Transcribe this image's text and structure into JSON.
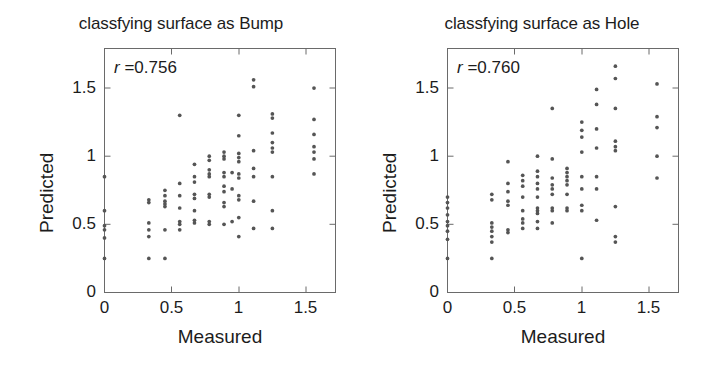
{
  "figure": {
    "background": "#ffffff",
    "point_color": "#555555",
    "axis_color": "#6a6a6a"
  },
  "panels": [
    {
      "id": "bump",
      "title": "classfying surface as Bump",
      "r_symbol": "r",
      "r_text": " =0.756",
      "annotation": "r =0.756"
    },
    {
      "id": "hole",
      "title": "classfying surface as Hole",
      "r_symbol": "r",
      "r_text": " =0.760",
      "annotation": "r =0.760"
    }
  ],
  "axes": {
    "xlabel": "Measured",
    "ylabel": "Predicted",
    "xticks": [
      "0",
      "0.5",
      "1",
      "1.5"
    ],
    "yticks": [
      "0",
      "0.5",
      "1",
      "1.5"
    ],
    "xtick_values": [
      0,
      0.5,
      1,
      1.5
    ],
    "ytick_values": [
      0,
      0.5,
      1,
      1.5
    ],
    "xlim": [
      0,
      1.72
    ],
    "ylim": [
      0,
      1.79
    ]
  },
  "chart_data": [
    {
      "type": "scatter",
      "title": "classfying surface as Bump",
      "xlabel": "Measured",
      "ylabel": "Predicted",
      "xlim": [
        0,
        1.72
      ],
      "ylim": [
        0,
        1.79
      ],
      "xticks": [
        0,
        0.5,
        1,
        1.5
      ],
      "yticks": [
        0,
        0.5,
        1,
        1.5
      ],
      "grid": false,
      "legend": "none",
      "annotations": [
        {
          "text": "r =0.756",
          "x": 0.08,
          "y": 1.66
        }
      ],
      "correlation_r": 0.756,
      "marker": {
        "shape": "circle",
        "size": 3,
        "color": "#555555"
      },
      "points": [
        [
          0.0,
          0.85
        ],
        [
          0.0,
          0.6
        ],
        [
          0.0,
          0.49
        ],
        [
          0.0,
          0.46
        ],
        [
          0.0,
          0.4
        ],
        [
          0.0,
          0.25
        ],
        [
          0.33,
          0.68
        ],
        [
          0.33,
          0.66
        ],
        [
          0.33,
          0.51
        ],
        [
          0.33,
          0.46
        ],
        [
          0.33,
          0.41
        ],
        [
          0.33,
          0.25
        ],
        [
          0.45,
          0.75
        ],
        [
          0.45,
          0.71
        ],
        [
          0.45,
          0.67
        ],
        [
          0.45,
          0.65
        ],
        [
          0.45,
          0.63
        ],
        [
          0.45,
          0.46
        ],
        [
          0.45,
          0.25
        ],
        [
          0.56,
          1.3
        ],
        [
          0.56,
          0.8
        ],
        [
          0.56,
          0.71
        ],
        [
          0.56,
          0.62
        ],
        [
          0.56,
          0.52
        ],
        [
          0.56,
          0.5
        ],
        [
          0.56,
          0.46
        ],
        [
          0.67,
          0.94
        ],
        [
          0.67,
          0.85
        ],
        [
          0.67,
          0.81
        ],
        [
          0.67,
          0.72
        ],
        [
          0.67,
          0.69
        ],
        [
          0.67,
          0.6
        ],
        [
          0.67,
          0.53
        ],
        [
          0.67,
          0.51
        ],
        [
          0.78,
          1.0
        ],
        [
          0.78,
          0.97
        ],
        [
          0.78,
          0.9
        ],
        [
          0.78,
          0.87
        ],
        [
          0.78,
          0.85
        ],
        [
          0.78,
          0.72
        ],
        [
          0.78,
          0.7
        ],
        [
          0.78,
          0.52
        ],
        [
          0.78,
          0.5
        ],
        [
          0.89,
          1.03
        ],
        [
          0.89,
          1.0
        ],
        [
          0.89,
          0.98
        ],
        [
          0.89,
          0.88
        ],
        [
          0.89,
          0.85
        ],
        [
          0.89,
          0.78
        ],
        [
          0.89,
          0.74
        ],
        [
          0.89,
          0.66
        ],
        [
          0.89,
          0.63
        ],
        [
          0.89,
          0.5
        ],
        [
          0.95,
          0.88
        ],
        [
          0.95,
          0.76
        ],
        [
          0.95,
          0.52
        ],
        [
          1.0,
          1.3
        ],
        [
          1.0,
          1.15
        ],
        [
          1.0,
          1.02
        ],
        [
          1.0,
          0.99
        ],
        [
          1.0,
          0.96
        ],
        [
          1.0,
          0.87
        ],
        [
          1.0,
          0.84
        ],
        [
          1.0,
          0.71
        ],
        [
          1.0,
          0.68
        ],
        [
          1.0,
          0.55
        ],
        [
          1.0,
          0.41
        ],
        [
          1.11,
          1.56
        ],
        [
          1.11,
          1.51
        ],
        [
          1.11,
          1.04
        ],
        [
          1.11,
          0.91
        ],
        [
          1.11,
          0.85
        ],
        [
          1.11,
          0.67
        ],
        [
          1.11,
          0.47
        ],
        [
          1.25,
          1.31
        ],
        [
          1.25,
          1.28
        ],
        [
          1.25,
          1.17
        ],
        [
          1.25,
          1.1
        ],
        [
          1.25,
          1.06
        ],
        [
          1.25,
          1.03
        ],
        [
          1.25,
          0.85
        ],
        [
          1.25,
          0.6
        ],
        [
          1.25,
          0.47
        ],
        [
          1.56,
          1.5
        ],
        [
          1.56,
          1.27
        ],
        [
          1.56,
          1.16
        ],
        [
          1.56,
          1.07
        ],
        [
          1.56,
          1.03
        ],
        [
          1.56,
          0.98
        ],
        [
          1.56,
          0.87
        ]
      ]
    },
    {
      "type": "scatter",
      "title": "classfying surface as Hole",
      "xlabel": "Measured",
      "ylabel": "Predicted",
      "xlim": [
        0,
        1.72
      ],
      "ylim": [
        0,
        1.79
      ],
      "xticks": [
        0,
        0.5,
        1,
        1.5
      ],
      "yticks": [
        0,
        0.5,
        1,
        1.5
      ],
      "grid": false,
      "legend": "none",
      "annotations": [
        {
          "text": "r =0.760",
          "x": 0.08,
          "y": 1.66
        }
      ],
      "correlation_r": 0.76,
      "marker": {
        "shape": "circle",
        "size": 3,
        "color": "#555555"
      },
      "points": [
        [
          0.0,
          0.7
        ],
        [
          0.0,
          0.66
        ],
        [
          0.0,
          0.62
        ],
        [
          0.0,
          0.57
        ],
        [
          0.0,
          0.52
        ],
        [
          0.0,
          0.49
        ],
        [
          0.0,
          0.45
        ],
        [
          0.0,
          0.39
        ],
        [
          0.0,
          0.25
        ],
        [
          0.33,
          0.72
        ],
        [
          0.33,
          0.68
        ],
        [
          0.33,
          0.51
        ],
        [
          0.33,
          0.48
        ],
        [
          0.33,
          0.45
        ],
        [
          0.33,
          0.41
        ],
        [
          0.33,
          0.37
        ],
        [
          0.33,
          0.25
        ],
        [
          0.45,
          0.96
        ],
        [
          0.45,
          0.8
        ],
        [
          0.45,
          0.74
        ],
        [
          0.45,
          0.67
        ],
        [
          0.45,
          0.64
        ],
        [
          0.45,
          0.46
        ],
        [
          0.45,
          0.44
        ],
        [
          0.56,
          0.86
        ],
        [
          0.56,
          0.82
        ],
        [
          0.56,
          0.78
        ],
        [
          0.56,
          0.7
        ],
        [
          0.56,
          0.6
        ],
        [
          0.56,
          0.54
        ],
        [
          0.56,
          0.51
        ],
        [
          0.56,
          0.47
        ],
        [
          0.67,
          1.0
        ],
        [
          0.67,
          0.89
        ],
        [
          0.67,
          0.85
        ],
        [
          0.67,
          0.8
        ],
        [
          0.67,
          0.76
        ],
        [
          0.67,
          0.7
        ],
        [
          0.67,
          0.62
        ],
        [
          0.67,
          0.6
        ],
        [
          0.67,
          0.58
        ],
        [
          0.67,
          0.52
        ],
        [
          0.67,
          0.47
        ],
        [
          0.78,
          1.35
        ],
        [
          0.78,
          0.98
        ],
        [
          0.78,
          0.84
        ],
        [
          0.78,
          0.79
        ],
        [
          0.78,
          0.76
        ],
        [
          0.78,
          0.72
        ],
        [
          0.78,
          0.62
        ],
        [
          0.78,
          0.6
        ],
        [
          0.78,
          0.51
        ],
        [
          0.89,
          0.91
        ],
        [
          0.89,
          0.88
        ],
        [
          0.89,
          0.85
        ],
        [
          0.89,
          0.82
        ],
        [
          0.89,
          0.79
        ],
        [
          0.89,
          0.72
        ],
        [
          0.89,
          0.62
        ],
        [
          0.89,
          0.6
        ],
        [
          1.0,
          1.25
        ],
        [
          1.0,
          1.19
        ],
        [
          1.0,
          1.14
        ],
        [
          1.0,
          1.03
        ],
        [
          1.0,
          0.85
        ],
        [
          1.0,
          0.76
        ],
        [
          1.0,
          0.64
        ],
        [
          1.0,
          0.6
        ],
        [
          1.0,
          0.25
        ],
        [
          1.11,
          1.49
        ],
        [
          1.11,
          1.38
        ],
        [
          1.11,
          1.2
        ],
        [
          1.11,
          1.06
        ],
        [
          1.11,
          0.85
        ],
        [
          1.11,
          0.76
        ],
        [
          1.11,
          0.53
        ],
        [
          1.25,
          1.66
        ],
        [
          1.25,
          1.57
        ],
        [
          1.25,
          1.35
        ],
        [
          1.25,
          1.11
        ],
        [
          1.25,
          1.07
        ],
        [
          1.25,
          1.04
        ],
        [
          1.25,
          0.63
        ],
        [
          1.25,
          0.41
        ],
        [
          1.25,
          0.37
        ],
        [
          1.56,
          1.53
        ],
        [
          1.56,
          1.29
        ],
        [
          1.56,
          1.21
        ],
        [
          1.56,
          1.0
        ],
        [
          1.56,
          0.84
        ]
      ]
    }
  ]
}
